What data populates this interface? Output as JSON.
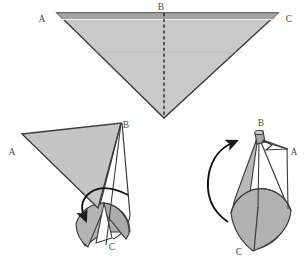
{
  "figure": {
    "name": "triangle-to-cone-folding-diagram",
    "background_color": "#ffffff",
    "stroke_color": "#2b2b2b",
    "fill_light": "#c9c9c9",
    "fill_mid": "#b5b5b5",
    "fill_dark": "#a8a8a8",
    "label_color": "#4a4a4a",
    "panels": [
      {
        "id": "panel-flat-triangle",
        "caption": "",
        "vertex_labels": [
          {
            "key": "A",
            "text": "A",
            "x": 42,
            "y": 19
          },
          {
            "key": "B",
            "text": "B",
            "x": 160,
            "y": 11
          },
          {
            "key": "C",
            "text": "C",
            "x": 288,
            "y": 22
          }
        ],
        "dashed_fold_line": true
      },
      {
        "id": "panel-partial-roll",
        "caption": "",
        "vertex_labels": [
          {
            "key": "A",
            "text": "A",
            "x": 12,
            "y": 153
          },
          {
            "key": "B",
            "text": "B",
            "x": 123,
            "y": 128
          },
          {
            "key": "C",
            "text": "C",
            "x": 110,
            "y": 246
          }
        ],
        "has_motion_arrow": true
      },
      {
        "id": "panel-cone",
        "caption": "",
        "vertex_labels": [
          {
            "key": "B",
            "text": "B",
            "x": 262,
            "y": 126
          },
          {
            "key": "A",
            "text": "A",
            "x": 292,
            "y": 153
          },
          {
            "key": "C",
            "text": "C",
            "x": 238,
            "y": 252
          }
        ],
        "has_motion_arrow": true
      }
    ],
    "all_labels": [
      "A",
      "B",
      "C",
      "A",
      "B",
      "C",
      "B",
      "A",
      "C"
    ]
  }
}
